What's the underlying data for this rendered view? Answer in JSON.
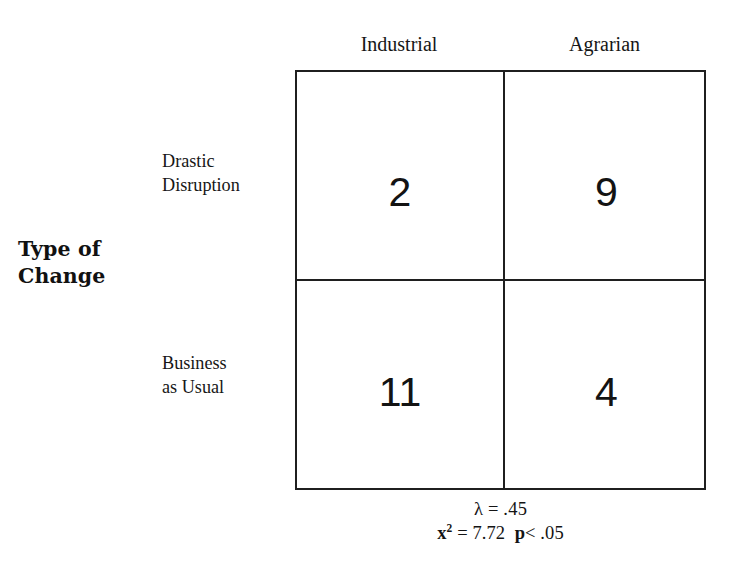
{
  "figure": {
    "axis_title": {
      "lines": [
        "Type of",
        "Change"
      ]
    },
    "column_headers": [
      "Industrial",
      "Agrarian"
    ],
    "row_labels": [
      {
        "lines": [
          "Drastic",
          "Disruption"
        ]
      },
      {
        "lines": [
          "Business",
          "as Usual"
        ]
      }
    ],
    "cells": [
      [
        "2",
        "9"
      ],
      [
        "11",
        "4"
      ]
    ],
    "statistics": {
      "lambda_line": "λ = .45",
      "chi_symbol": "x",
      "chi_exponent": "2",
      "chi_value": " = 7.72  ",
      "p_symbol": "p",
      "p_value": "< .05"
    },
    "colors": {
      "ink": "#1f1f1f",
      "background": "#ffffff"
    }
  },
  "chart_data": {
    "type": "table",
    "title": "Type of Change",
    "xlabel": "",
    "ylabel": "Type of Change",
    "categories": [
      "Industrial",
      "Agrarian"
    ],
    "row_categories": [
      "Drastic Disruption",
      "Business as Usual"
    ],
    "values": [
      [
        2,
        9
      ],
      [
        11,
        4
      ]
    ],
    "series": [
      {
        "name": "Drastic Disruption",
        "values": [
          2,
          9
        ]
      },
      {
        "name": "Business as Usual",
        "values": [
          11,
          4
        ]
      }
    ],
    "annotations": [
      "λ = .45",
      "x² = 7.72  p< .05"
    ],
    "statistics": {
      "lambda": 0.45,
      "chi_square": 7.72,
      "p": "< .05"
    },
    "grid": true,
    "legend": "none"
  }
}
